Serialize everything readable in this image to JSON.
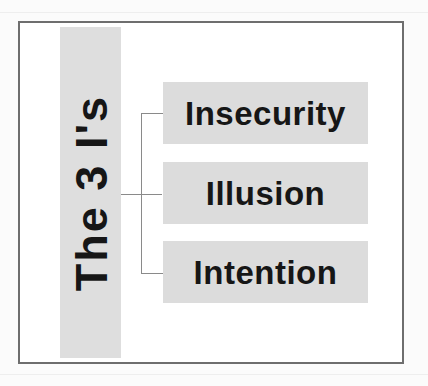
{
  "diagram": {
    "title": "The 3 I's",
    "items": [
      {
        "label": "Insecurity"
      },
      {
        "label": "Illusion"
      },
      {
        "label": "Intention"
      }
    ],
    "colors": {
      "frame_border": "#6e6e6e",
      "box_fill": "#dcdcdc",
      "title_bar_fill": "#dedede",
      "text": "#161616",
      "connector": "#8a8a8a"
    }
  }
}
